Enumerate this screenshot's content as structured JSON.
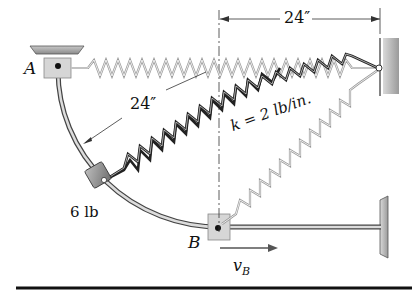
{
  "figure": {
    "point_a_label": "A",
    "point_b_label": "B",
    "radius_dimension": "24″",
    "horizontal_dimension": "24″",
    "collar_weight": "6 lb",
    "spring_constant": "k = 2 lb/in.",
    "velocity_label": "v",
    "velocity_subscript": "B"
  }
}
